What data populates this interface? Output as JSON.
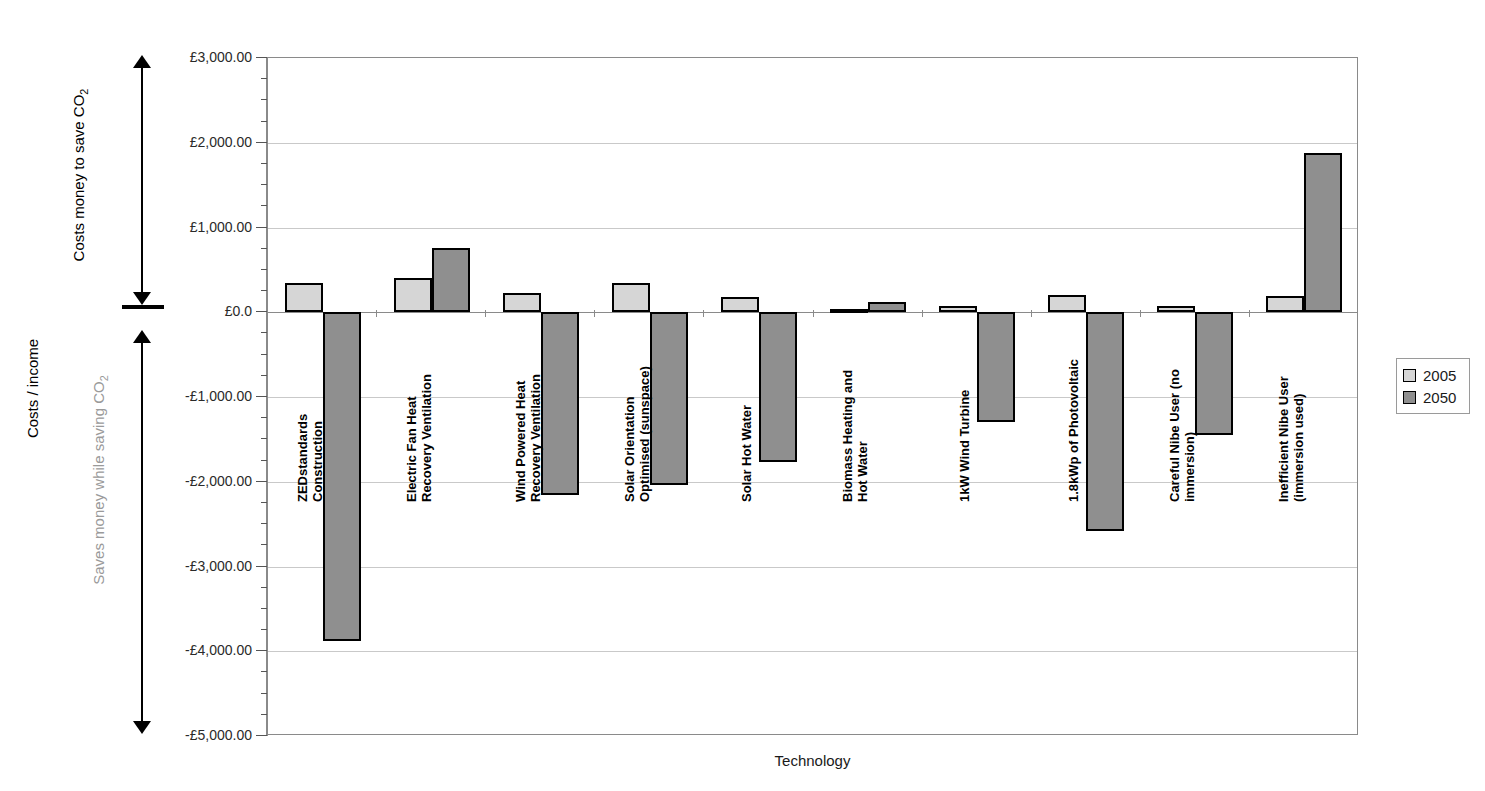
{
  "top_clipped_text": "",
  "axis": {
    "y_title": "Costs / income",
    "x_title": "Technology",
    "y_ticks": [
      "£3,000.00",
      "£2,000.00",
      "£1,000.00",
      "£0.0",
      "-£1,000.00",
      "-£2,000.00",
      "-£3,000.00",
      "-£4,000.00",
      "-£5,000.00"
    ]
  },
  "annotations": {
    "upper": "Costs money to save CO",
    "upper_sub": "2",
    "lower": "Saves money while saving CO",
    "lower_sub": "2"
  },
  "legend": {
    "items": [
      {
        "label": "2005",
        "color": "#d6d6d6"
      },
      {
        "label": "2050",
        "color": "#8f8f8f"
      }
    ]
  },
  "categories": [
    {
      "line1": "ZEDstandards",
      "line2": "Construction"
    },
    {
      "line1": "Electric Fan Heat",
      "line2": "Recovery Ventilation"
    },
    {
      "line1": "Wind Powered Heat",
      "line2": "Recovery Ventilation"
    },
    {
      "line1": "Solar Orientation",
      "line2": "Optimised (sunspace)"
    },
    {
      "line1": "Solar Hot Water",
      "line2": ""
    },
    {
      "line1": "Biomass Heating and",
      "line2": "Hot Water"
    },
    {
      "line1": "1kW Wind Turbine",
      "line2": ""
    },
    {
      "line1": "1.8kWp of Photovoltaic",
      "line2": ""
    },
    {
      "line1": "Careful Nibe User (no",
      "line2": "immersion)"
    },
    {
      "line1": "Inefficient Nibe User",
      "line2": "(immersion used)"
    }
  ],
  "chart_data": {
    "type": "bar",
    "title": "",
    "xlabel": "Technology",
    "ylabel": "Costs / income",
    "ylim": [
      -5000,
      3000
    ],
    "ytick_values": [
      3000,
      2000,
      1000,
      0,
      -1000,
      -2000,
      -3000,
      -4000,
      -5000
    ],
    "grid": true,
    "legend_position": "right",
    "currency": "GBP",
    "categories": [
      "ZEDstandards Construction",
      "Electric Fan Heat Recovery Ventilation",
      "Wind Powered Heat Recovery Ventilation",
      "Solar Orientation Optimised (sunspace)",
      "Solar Hot Water",
      "Biomass Heating and Hot Water",
      "1kW Wind Turbine",
      "1.8kWp of Photovoltaic",
      "Careful Nibe User (no immersion)",
      "Inefficient Nibe User (immersion used)"
    ],
    "series": [
      {
        "name": "2005",
        "color": "#d6d6d6",
        "values": [
          340,
          410,
          230,
          340,
          180,
          40,
          70,
          200,
          70,
          190
        ]
      },
      {
        "name": "2050",
        "color": "#8f8f8f",
        "values": [
          -3880,
          760,
          -2160,
          -2040,
          -1770,
          120,
          -1300,
          -2580,
          -1450,
          1880
        ]
      }
    ]
  }
}
